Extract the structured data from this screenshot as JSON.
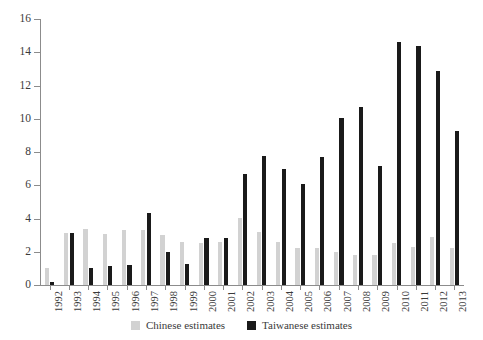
{
  "chart_data": {
    "type": "bar",
    "title": "",
    "subtitle": "",
    "xlabel": "",
    "ylabel": "",
    "ylim": [
      0,
      16
    ],
    "yticks": [
      0,
      2,
      4,
      6,
      8,
      10,
      12,
      14,
      16
    ],
    "grid": false,
    "legend_position": "bottom",
    "categories": [
      "1992",
      "1993",
      "1994",
      "1995",
      "1996",
      "1997",
      "1998",
      "1999",
      "2000",
      "2001",
      "2002",
      "2003",
      "2004",
      "2005",
      "2006",
      "2007",
      "2008",
      "2009",
      "2010",
      "2011",
      "2012",
      "2013"
    ],
    "series": [
      {
        "name": "Chinese estimates",
        "color": "#d2d2d2",
        "values": [
          1.05,
          3.1,
          3.35,
          3.05,
          3.3,
          3.3,
          3.0,
          2.6,
          2.5,
          2.6,
          4.05,
          3.2,
          2.6,
          2.2,
          2.2,
          2.0,
          1.8,
          1.8,
          2.5,
          2.3,
          2.9,
          2.2
        ]
      },
      {
        "name": "Taiwanese estimates",
        "color": "#1a1a1a",
        "values": [
          0.2,
          3.15,
          1.0,
          1.15,
          1.2,
          4.35,
          2.0,
          1.25,
          2.85,
          2.85,
          6.7,
          7.75,
          7.0,
          6.05,
          7.7,
          10.05,
          10.7,
          7.15,
          14.6,
          14.35,
          12.85,
          9.25
        ]
      }
    ]
  },
  "legend": {
    "items": [
      {
        "label": "Chinese estimates",
        "color": "#d2d2d2"
      },
      {
        "label": "Taiwanese estimates",
        "color": "#1a1a1a"
      }
    ]
  }
}
